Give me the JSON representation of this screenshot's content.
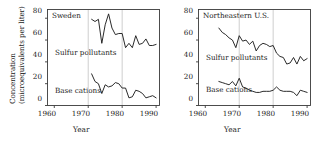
{
  "figure": {
    "axis_y_title_line1": "Concentration",
    "axis_y_title_line2": "(microequivalents per liter)",
    "axis_x_title": "Year",
    "line_color": "#1f1f1f",
    "grid_color": "#b9b9b9",
    "axis_color": "#3a3a3a"
  },
  "chart_data": [
    {
      "type": "line",
      "title": "Sweden",
      "xlabel": "Year",
      "ylabel": "Concentration (microequivalents per liter)",
      "xlim": [
        1958,
        1991
      ],
      "ylim": [
        0,
        88
      ],
      "xticks": [
        1960,
        1970,
        1980,
        1990
      ],
      "yticks": [
        0,
        20,
        40,
        60,
        80
      ],
      "gridlines_x": [
        1970,
        1980
      ],
      "grid": true,
      "legend": "inline-labels",
      "series": [
        {
          "name": "Sulfur pollutants",
          "label_x": 1962.5,
          "label_y": 47,
          "x": [
            1971,
            1972,
            1973,
            1974,
            1975,
            1976,
            1977,
            1978,
            1979,
            1980,
            1981,
            1982,
            1983,
            1984,
            1985,
            1986,
            1987,
            1988,
            1989,
            1990
          ],
          "values": [
            79,
            77,
            79,
            57,
            74,
            84,
            71,
            65,
            66,
            66,
            53,
            57,
            53,
            64,
            56,
            57,
            61,
            55,
            55,
            56
          ]
        },
        {
          "name": "Base cations",
          "label_x": 1962.5,
          "label_y": 8,
          "x": [
            1971,
            1972,
            1973,
            1974,
            1975,
            1976,
            1977,
            1978,
            1979,
            1980,
            1981,
            1982,
            1983,
            1984,
            1985,
            1986,
            1987,
            1988,
            1989,
            1990
          ],
          "values": [
            29,
            22,
            20,
            11,
            19,
            17,
            18,
            21,
            20,
            16,
            16,
            7,
            8,
            14,
            13,
            11,
            7,
            8,
            9,
            7
          ]
        }
      ]
    },
    {
      "type": "line",
      "title": "Northeastern U.S.",
      "xlabel": "Year",
      "ylabel": "Concentration (microequivalents per liter)",
      "xlim": [
        1958,
        1991
      ],
      "ylim": [
        0,
        88
      ],
      "xticks": [
        1960,
        1970,
        1980,
        1990
      ],
      "yticks": [
        0,
        20,
        40,
        60,
        80
      ],
      "gridlines_x": [
        1970,
        1980
      ],
      "grid": true,
      "legend": "inline-labels",
      "series": [
        {
          "name": "Sulfur pollutants",
          "label_x": 1962.5,
          "label_y": 41,
          "x": [
            1964,
            1965,
            1966,
            1967,
            1968,
            1969,
            1970,
            1971,
            1972,
            1973,
            1974,
            1975,
            1976,
            1977,
            1978,
            1979,
            1980,
            1981,
            1982,
            1983,
            1984,
            1985,
            1986,
            1987,
            1988,
            1989,
            1990
          ],
          "values": [
            71,
            67,
            65,
            62,
            60,
            53,
            64,
            59,
            60,
            56,
            59,
            50,
            55,
            57,
            56,
            54,
            55,
            48,
            45,
            44,
            38,
            39,
            44,
            38,
            45,
            41,
            43
          ]
        },
        {
          "name": "Base cations",
          "label_x": 1962.5,
          "label_y": 9,
          "x": [
            1964,
            1965,
            1966,
            1967,
            1968,
            1969,
            1970,
            1971,
            1972,
            1973,
            1974,
            1975,
            1976,
            1977,
            1978,
            1979,
            1980,
            1981,
            1982,
            1983,
            1984,
            1985,
            1986,
            1987,
            1988,
            1989,
            1990
          ],
          "values": [
            22,
            21,
            20,
            19,
            22,
            18,
            25,
            17,
            16,
            14,
            13,
            12,
            12,
            13,
            13,
            13,
            14,
            17,
            14,
            13,
            13,
            13,
            12,
            9,
            14,
            13,
            12
          ]
        }
      ]
    }
  ]
}
